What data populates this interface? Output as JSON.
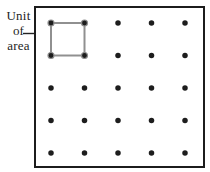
{
  "annotation": {
    "lines": [
      "Unit",
      "of",
      "area"
    ]
  },
  "board": {
    "background": "#ffffff",
    "border_color": "#1c1c1c",
    "border_width": 2,
    "rect": {
      "x": 35,
      "y": 7,
      "width": 169,
      "height": 160
    },
    "dot_columns_x": [
      51,
      84.5,
      118,
      151.5,
      185
    ],
    "dot_rows_y": [
      23,
      55.5,
      88,
      120.5,
      153
    ],
    "dot_radius": 2.75,
    "dot_color": "#1d1d1d",
    "corner_dot_radius": 3,
    "corner_dot_ring": "#8f8f8f",
    "unit_square": {
      "x": 51,
      "y": 23,
      "width": 33.5,
      "height": 32.5,
      "stroke": "#909090",
      "stroke_width": 2
    }
  }
}
